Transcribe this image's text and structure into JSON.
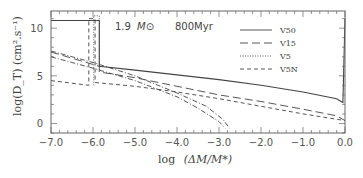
{
  "chart_data": {
    "type": "line",
    "title": "",
    "annotation": {
      "mass": "1.9 M⊙",
      "age": "800Myr"
    },
    "xlabel": "log (ΔM/M*)",
    "ylabel": "log(D_T) (cm².s⁻¹)",
    "xlim": [
      -7.0,
      0.0
    ],
    "ylim": [
      -1.0,
      11.8
    ],
    "x_ticks": [
      "-7.0",
      "-6.0",
      "-5.0",
      "-4.0",
      "-3.0",
      "-2.0",
      "-1.0",
      "0.0"
    ],
    "y_ticks": [
      "0",
      "5",
      "10"
    ],
    "grid": false,
    "legend_position": "upper right",
    "legend": [
      "V50",
      "V15",
      "V5",
      "V5N"
    ],
    "series": [
      {
        "name": "V50",
        "style": "solid",
        "x": [
          -7.0,
          -5.85,
          -5.85,
          -5.0,
          -4.0,
          -3.0,
          -2.0,
          -1.0,
          -0.2,
          -0.05,
          0.0
        ],
        "y": [
          10.8,
          10.8,
          6.0,
          5.6,
          5.1,
          4.6,
          4.0,
          3.3,
          2.6,
          2.2,
          11.0
        ]
      },
      {
        "name": "V15",
        "style": "long-dash",
        "x": [
          -7.0,
          -5.85,
          -5.85,
          -5.0,
          -4.0,
          -3.0,
          -2.0,
          -1.0,
          -0.2,
          0.0
        ],
        "y": [
          7.5,
          6.0,
          5.4,
          4.8,
          3.9,
          3.0,
          2.3,
          1.5,
          0.8,
          0.3
        ]
      },
      {
        "name": "V5",
        "style": "dotted",
        "x": [
          -5.98,
          -5.98,
          -5.85,
          -5.85
        ],
        "y": [
          4.0,
          11.3,
          11.3,
          6.0
        ]
      },
      {
        "name": "V5N",
        "style": "short-dash",
        "x": [
          -7.0,
          -6.1,
          -6.1,
          -5.95,
          -5.95,
          -5.0,
          -4.0,
          -3.0,
          -2.0,
          -1.0,
          0.0
        ],
        "y": [
          4.5,
          4.0,
          11.0,
          11.0,
          4.3,
          3.9,
          3.3,
          2.6,
          1.8,
          1.0,
          0.3
        ]
      },
      {
        "name": "dot-dash-1",
        "style": "dot-dash",
        "x": [
          -7.0,
          -6.0,
          -5.0,
          -4.0,
          -3.5,
          -3.0,
          -2.85
        ],
        "y": [
          7.0,
          5.8,
          4.5,
          2.8,
          1.6,
          0.2,
          -0.5
        ]
      },
      {
        "name": "dot-dash-2",
        "style": "dot-dash",
        "x": [
          -7.0,
          -6.0,
          -5.0,
          -4.0,
          -3.3,
          -2.9,
          -2.75
        ],
        "y": [
          7.6,
          6.4,
          5.0,
          3.2,
          1.8,
          0.4,
          -0.5
        ]
      }
    ]
  },
  "labels": {
    "x_axis": "log",
    "x_axis_expr": "(ΔM/M*)",
    "y_axis": "log(D_T) (cm².s⁻¹)",
    "mass_value": "1.9",
    "mass_unit": "M⊙",
    "age": "800Myr"
  },
  "legend": [
    {
      "label": "V50",
      "dash": ""
    },
    {
      "label": "V15",
      "dash": "8,4"
    },
    {
      "label": "V5",
      "dash": "1,2"
    },
    {
      "label": "V5N",
      "dash": "4,3"
    }
  ],
  "ticks": {
    "x": [
      "−7.0",
      "−6.0",
      "−5.0",
      "−4.0",
      "−3.0",
      "−2.0",
      "−1.0",
      "0.0"
    ],
    "y": [
      "0",
      "5",
      "10"
    ]
  }
}
